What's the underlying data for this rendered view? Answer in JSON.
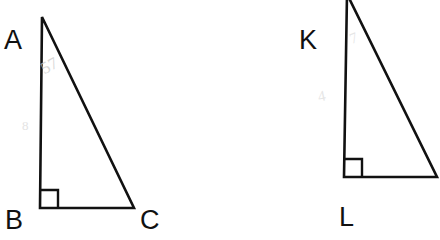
{
  "figure": {
    "background_color": "#ffffff",
    "stroke_color": "#111111",
    "faint_mark_color": "#c9c9c9",
    "shapes": [
      {
        "name": "triangle-abc",
        "labels": [
          "A",
          "B",
          "C"
        ],
        "right_angle_at": "B",
        "vertices": {
          "A": [
            42,
            17
          ],
          "B": [
            40,
            208
          ],
          "C": [
            134,
            208
          ]
        },
        "right_angle_marker_size": 18
      },
      {
        "name": "triangle-klm",
        "labels": [
          "K",
          "L"
        ],
        "right_angle_at": "L",
        "vertices": {
          "K": [
            347,
            -4
          ],
          "L": [
            344,
            177
          ],
          "M": [
            437,
            177
          ]
        },
        "right_angle_marker_size": 18
      }
    ]
  },
  "labels": {
    "a": "A",
    "b": "B",
    "c": "C",
    "k": "K",
    "l": "L"
  },
  "faint_marks": {
    "left_upper": "57",
    "left_middle": "8",
    "right_upper": "7",
    "right_middle": "4"
  }
}
